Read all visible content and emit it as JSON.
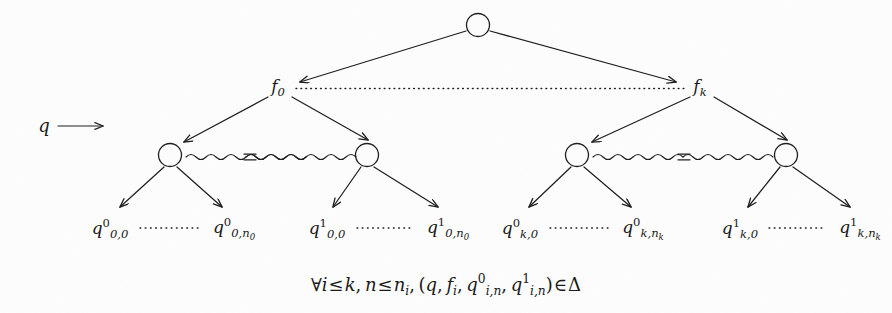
{
  "figure": {
    "background_color": "#fdfdfd",
    "ink_color": "#1f1f1f",
    "width": 892,
    "height": 313
  },
  "root": {
    "name": "root-node",
    "shape": "circle",
    "cx": 478,
    "cy": 25,
    "r": 12
  },
  "input_label": {
    "text": "q",
    "arrow": "⟶",
    "x": 38,
    "y": 127
  },
  "level1": [
    {
      "id": "f0",
      "base": "f",
      "sub": "0",
      "x": 278,
      "y": 88
    },
    {
      "id": "fk",
      "base": "f",
      "sub": "k",
      "x": 700,
      "y": 88
    }
  ],
  "level1_connector": {
    "style": "dotted",
    "x1": 296,
    "x2": 686,
    "y": 88
  },
  "level2_nodes": [
    {
      "id": "n0-left",
      "cx": 170,
      "cy": 155,
      "r": 12
    },
    {
      "id": "n0-right",
      "cx": 367,
      "cy": 155,
      "r": 12
    },
    {
      "id": "nk-left",
      "cx": 577,
      "cy": 155,
      "r": 12
    },
    {
      "id": "nk-right",
      "cx": 786,
      "cy": 155,
      "r": 12
    }
  ],
  "squiggle_connectors": [
    {
      "id": "squiggle-0",
      "x1": 186,
      "x2": 352,
      "y": 157,
      "middle_symbol": "="
    },
    {
      "id": "squiggle-k",
      "x1": 593,
      "x2": 771,
      "y": 157,
      "middle_symbol": "="
    }
  ],
  "leaves": [
    {
      "id": "leaf-0-0-0",
      "base": "q",
      "sup": "0",
      "sub": "0,0",
      "sub2": "",
      "x": 110,
      "y": 229
    },
    {
      "id": "leaf-0-0-n0",
      "base": "q",
      "sup": "0",
      "sub": "0,n",
      "sub2": "0",
      "x": 234,
      "y": 229
    },
    {
      "id": "leaf-0-1-0",
      "base": "q",
      "sup": "1",
      "sub": "0,0",
      "sub2": "",
      "x": 327,
      "y": 229
    },
    {
      "id": "leaf-0-1-n0",
      "base": "q",
      "sup": "1",
      "sub": "0,n",
      "sub2": "0",
      "x": 448,
      "y": 229
    },
    {
      "id": "leaf-k-0-0",
      "base": "q",
      "sup": "0",
      "sub": "k,0",
      "sub2": "",
      "x": 520,
      "y": 229
    },
    {
      "id": "leaf-k-0-nk",
      "base": "q",
      "sup": "0",
      "sub": "k,n",
      "sub2": "k",
      "x": 643,
      "y": 229
    },
    {
      "id": "leaf-k-1-0",
      "base": "q",
      "sup": "1",
      "sub": "k,0",
      "sub2": "",
      "x": 740,
      "y": 229
    },
    {
      "id": "leaf-k-1-nk",
      "base": "q",
      "sup": "1",
      "sub": "k,n",
      "sub2": "k",
      "x": 860,
      "y": 229
    }
  ],
  "leaf_dotted_links": [
    {
      "id": "dots-0-0",
      "x1": 138,
      "x2": 202,
      "y": 228
    },
    {
      "id": "dots-0-1",
      "x1": 355,
      "x2": 416,
      "y": 228
    },
    {
      "id": "dots-k-0",
      "x1": 548,
      "x2": 611,
      "y": 228
    },
    {
      "id": "dots-k-1",
      "x1": 767,
      "x2": 828,
      "y": 228
    }
  ],
  "formula": {
    "x": 446,
    "y": 285,
    "parts": {
      "forall": "∀",
      "i": "i",
      "leq1": "≤",
      "k": "k",
      "comma1": ",",
      "n": "n",
      "leq2": "≤",
      "n_sub": "n",
      "n_subsub": "i",
      "comma2": ",",
      "open_paren": "(",
      "q": "q",
      "comma3": ",",
      "f": "f",
      "f_sub": "i",
      "comma4": ",",
      "q0": "q",
      "q0_sup": "0",
      "q0_sub": "i,n",
      "comma5": ",",
      "q1": "q",
      "q1_sup": "1",
      "q1_sub": "i,n",
      "close_paren": ")",
      "in": "∈",
      "delta": "Δ"
    },
    "plain": "∀i ≤ k, n ≤ n_i, (q, f_i, q^0_{i,n}, q^1_{i,n}) ∈ Δ"
  }
}
